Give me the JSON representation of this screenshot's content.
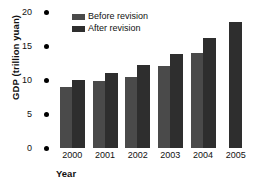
{
  "chart_data": {
    "type": "bar",
    "title": "",
    "xlabel": "Year",
    "ylabel": "GDP (trillion yuan)",
    "categories": [
      "2000",
      "2001",
      "2002",
      "2003",
      "2004",
      "2005"
    ],
    "series": [
      {
        "name": "Before revision",
        "color": "#4a4a4a",
        "values": [
          9.0,
          9.8,
          10.5,
          12.0,
          14.0,
          null
        ]
      },
      {
        "name": "After revision",
        "color": "#2e2e2e",
        "values": [
          10.0,
          11.0,
          12.2,
          13.8,
          16.2,
          18.5
        ]
      }
    ],
    "ylim": [
      0,
      20
    ],
    "yticks": [
      0,
      5,
      10,
      15,
      20
    ],
    "ytick_labels": [
      "0",
      "5",
      "10",
      "15",
      "20"
    ],
    "grid": false,
    "legend_position": "top-left",
    "tick_marker": "round-dot"
  },
  "colors": {
    "background": "#ffffff",
    "text": "#111111",
    "tick_dot": "#000000",
    "before_revision": "#4a4a4a",
    "after_revision": "#2e2e2e"
  }
}
